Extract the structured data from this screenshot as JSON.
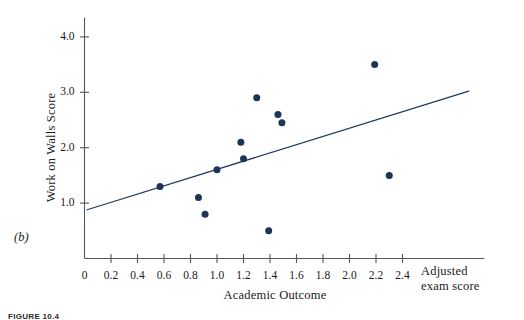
{
  "figure": {
    "panel_label": "(b)",
    "caption": "FIGURE 10.4"
  },
  "chart_data": {
    "type": "scatter",
    "title": "",
    "xlabel": "Academic Outcome",
    "ylabel": "Work on Walls Score",
    "x_axis_end_label_line1": "Adjusted",
    "x_axis_end_label_line2": "exam score",
    "xlim": [
      0,
      2.55
    ],
    "ylim": [
      0,
      4.35
    ],
    "grid": false,
    "legend": "none",
    "point_color": "#1c3557",
    "line_color": "#1f3a60",
    "axis_color": "#55565a",
    "xticks": [
      0,
      0.2,
      0.4,
      0.6,
      0.8,
      1.0,
      1.2,
      1.4,
      1.6,
      1.8,
      2.0,
      2.2,
      2.4
    ],
    "xtick_labels": [
      "0",
      "0.2",
      "0.4",
      "0.6",
      "0.8",
      "1.0",
      "1.2",
      "1.4",
      "1.6",
      "1.8",
      "2.0",
      "2.2",
      "2.4"
    ],
    "yticks": [
      1.0,
      2.0,
      3.0,
      4.0
    ],
    "ytick_labels": [
      "1.0",
      "2.0",
      "3.0",
      "4.0"
    ],
    "points": [
      {
        "x": 0.57,
        "y": 1.3
      },
      {
        "x": 0.86,
        "y": 1.1
      },
      {
        "x": 0.91,
        "y": 0.8
      },
      {
        "x": 1.0,
        "y": 1.6
      },
      {
        "x": 1.18,
        "y": 2.1
      },
      {
        "x": 1.2,
        "y": 1.8
      },
      {
        "x": 1.3,
        "y": 2.9
      },
      {
        "x": 1.39,
        "y": 0.5
      },
      {
        "x": 1.46,
        "y": 2.6
      },
      {
        "x": 1.49,
        "y": 2.45
      },
      {
        "x": 2.19,
        "y": 3.5
      },
      {
        "x": 2.3,
        "y": 1.5
      }
    ],
    "fit_line": {
      "x_start": 0.02,
      "y_start": 0.88,
      "x_end": 2.9,
      "y_end": 3.02
    }
  }
}
